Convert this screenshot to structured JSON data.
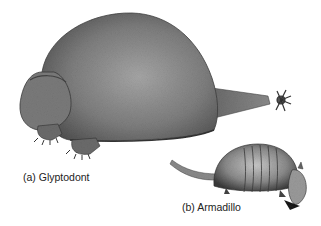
{
  "figure": {
    "panels": [
      {
        "id": "a",
        "label": "(a) Glyptodont",
        "subject": "glyptodont-illustration"
      },
      {
        "id": "b",
        "label": "(b) Armadillo",
        "subject": "armadillo-illustration"
      }
    ],
    "colors": {
      "background": "#ffffff",
      "shell_dark": "#4a4a4a",
      "shell_mid": "#7a7a7a",
      "shell_light": "#a8a8a8",
      "text": "#222222"
    }
  }
}
